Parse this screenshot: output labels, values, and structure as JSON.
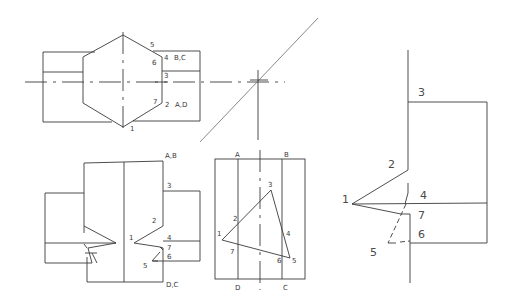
{
  "drawing": {
    "title": "Projection of a hexagonal prism with a triangular cut",
    "top_view": {
      "labels": {
        "p5": "5",
        "p6": "6",
        "p4": "4",
        "bc": "B,C",
        "p3": "3",
        "p7": "7",
        "p2": "2",
        "ad": "A,D",
        "p1": "1"
      }
    },
    "front_view": {
      "labels": {
        "ab": "A,B",
        "p3": "3",
        "p2": "2",
        "p1": "1",
        "p4": "4",
        "p7": "7",
        "p6": "6",
        "p5": "5",
        "dc": "D,C"
      }
    },
    "side_view": {
      "labels": {
        "a": "A",
        "b": "B",
        "p3": "3",
        "p2": "2",
        "p1": "1",
        "p4": "4",
        "p7": "7",
        "p6": "6",
        "p5": "5",
        "d": "D",
        "c": "C"
      }
    },
    "true_shape": {
      "labels": {
        "p3": "3",
        "p2": "2",
        "p1": "1",
        "p4": "4",
        "p7": "7",
        "p6": "6",
        "p5": "5"
      }
    }
  }
}
